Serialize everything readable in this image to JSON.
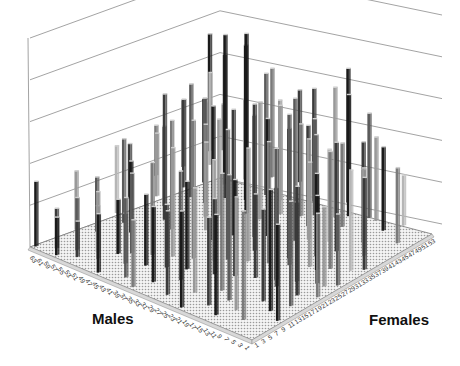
{
  "chart_data": {
    "type": "bar3d",
    "title": "",
    "x_axis": {
      "label": "Males",
      "ticks": [
        63,
        61,
        59,
        57,
        55,
        53,
        51,
        49,
        47,
        45,
        43,
        41,
        39,
        37,
        35,
        33,
        31,
        29,
        27,
        25,
        23,
        21,
        19,
        17,
        15,
        13,
        11,
        9,
        7,
        5,
        3,
        1
      ]
    },
    "y_axis": {
      "label": "Females",
      "ticks": [
        1,
        3,
        5,
        7,
        9,
        11,
        13,
        15,
        17,
        19,
        21,
        23,
        25,
        27,
        29,
        31,
        33,
        35,
        37,
        39,
        41,
        43,
        45,
        47,
        49,
        51,
        53
      ]
    },
    "z_axis": {
      "label": "",
      "gridlines": 5,
      "tick_labels_visible": false
    },
    "grid": true,
    "legend": null,
    "bar_colors": [
      "#1a1a1a",
      "#3a3a3a",
      "#5a5a5a",
      "#7a7a7a",
      "#999999",
      "#b5b5b5"
    ],
    "note": "Sparse 3D bar matrix of male × female pairings; individual bar heights are not labeled. Tallest bar ≈ 4.3 gridline units near the back-right; most bars between 0.5 and 3 units.",
    "bars": [
      {
        "m": 63,
        "f": 1,
        "h": 1.55,
        "c": 0
      },
      {
        "m": 59,
        "f": 3,
        "h": 0.95,
        "c": 1
      },
      {
        "m": 57,
        "f": 1,
        "h": 0.9,
        "c": 0
      },
      {
        "m": 55,
        "f": 5,
        "h": 1.25,
        "c": 2
      },
      {
        "m": 53,
        "f": 3,
        "h": 0.85,
        "c": 1
      },
      {
        "m": 51,
        "f": 7,
        "h": 1.1,
        "c": 3
      },
      {
        "m": 49,
        "f": 5,
        "h": 1.6,
        "c": 4
      },
      {
        "m": 47,
        "f": 9,
        "h": 1.3,
        "c": 0
      },
      {
        "m": 45,
        "f": 11,
        "h": 1.9,
        "c": 2
      },
      {
        "m": 43,
        "f": 7,
        "h": 1.2,
        "c": 1
      },
      {
        "m": 41,
        "f": 13,
        "h": 2.2,
        "c": 3
      },
      {
        "m": 39,
        "f": 9,
        "h": 1.7,
        "c": 0
      },
      {
        "m": 37,
        "f": 15,
        "h": 2.6,
        "c": 4
      },
      {
        "m": 35,
        "f": 11,
        "h": 1.5,
        "c": 1
      },
      {
        "m": 33,
        "f": 17,
        "h": 3.3,
        "c": 3
      },
      {
        "m": 31,
        "f": 13,
        "h": 2.1,
        "c": 0
      },
      {
        "m": 29,
        "f": 19,
        "h": 2.4,
        "c": 5
      },
      {
        "m": 27,
        "f": 21,
        "h": 3.1,
        "c": 2
      },
      {
        "m": 25,
        "f": 15,
        "h": 1.8,
        "c": 1
      },
      {
        "m": 23,
        "f": 23,
        "h": 2.7,
        "c": 4
      },
      {
        "m": 21,
        "f": 17,
        "h": 2.3,
        "c": 0
      },
      {
        "m": 19,
        "f": 25,
        "h": 2.9,
        "c": 3
      },
      {
        "m": 17,
        "f": 19,
        "h": 2.0,
        "c": 1
      },
      {
        "m": 15,
        "f": 27,
        "h": 3.6,
        "c": 2
      },
      {
        "m": 13,
        "f": 21,
        "h": 2.2,
        "c": 0
      },
      {
        "m": 11,
        "f": 29,
        "h": 2.5,
        "c": 4
      },
      {
        "m": 9,
        "f": 23,
        "h": 1.9,
        "c": 1
      },
      {
        "m": 7,
        "f": 31,
        "h": 2.8,
        "c": 3
      },
      {
        "m": 5,
        "f": 25,
        "h": 2.1,
        "c": 0
      },
      {
        "m": 3,
        "f": 33,
        "h": 2.4,
        "c": 5
      },
      {
        "m": 1,
        "f": 27,
        "h": 1.7,
        "c": 2
      },
      {
        "m": 61,
        "f": 11,
        "h": 1.4,
        "c": 4
      },
      {
        "m": 55,
        "f": 19,
        "h": 2.0,
        "c": 2
      },
      {
        "m": 49,
        "f": 25,
        "h": 3.0,
        "c": 1
      },
      {
        "m": 43,
        "f": 31,
        "h": 2.2,
        "c": 3
      },
      {
        "m": 37,
        "f": 37,
        "h": 4.3,
        "c": 0
      },
      {
        "m": 31,
        "f": 41,
        "h": 2.6,
        "c": 4
      },
      {
        "m": 25,
        "f": 45,
        "h": 2.3,
        "c": 2
      },
      {
        "m": 19,
        "f": 49,
        "h": 2.9,
        "c": 0
      },
      {
        "m": 13,
        "f": 51,
        "h": 2.0,
        "c": 4
      },
      {
        "m": 7,
        "f": 53,
        "h": 1.2,
        "c": 5
      },
      {
        "m": 3,
        "f": 47,
        "h": 1.8,
        "c": 3
      },
      {
        "m": 9,
        "f": 43,
        "h": 2.4,
        "c": 1
      },
      {
        "m": 15,
        "f": 39,
        "h": 2.2,
        "c": 5
      },
      {
        "m": 21,
        "f": 35,
        "h": 3.4,
        "c": 2
      },
      {
        "m": 27,
        "f": 33,
        "h": 2.8,
        "c": 0
      },
      {
        "m": 33,
        "f": 29,
        "h": 3.0,
        "c": 1
      },
      {
        "m": 39,
        "f": 27,
        "h": 2.1,
        "c": 4
      },
      {
        "m": 45,
        "f": 23,
        "h": 2.6,
        "c": 3
      },
      {
        "m": 51,
        "f": 17,
        "h": 1.7,
        "c": 0
      },
      {
        "m": 57,
        "f": 13,
        "h": 1.3,
        "c": 2
      },
      {
        "m": 59,
        "f": 21,
        "h": 1.6,
        "c": 5
      },
      {
        "m": 53,
        "f": 29,
        "h": 1.9,
        "c": 3
      },
      {
        "m": 47,
        "f": 35,
        "h": 2.5,
        "c": 2
      },
      {
        "m": 41,
        "f": 41,
        "h": 3.7,
        "c": 0
      },
      {
        "m": 35,
        "f": 45,
        "h": 2.4,
        "c": 4
      },
      {
        "m": 29,
        "f": 49,
        "h": 2.7,
        "c": 1
      },
      {
        "m": 23,
        "f": 53,
        "h": 3.2,
        "c": 0
      },
      {
        "m": 17,
        "f": 45,
        "h": 2.0,
        "c": 3
      },
      {
        "m": 11,
        "f": 37,
        "h": 2.6,
        "c": 1
      },
      {
        "m": 5,
        "f": 39,
        "h": 2.1,
        "c": 4
      },
      {
        "m": 1,
        "f": 9,
        "h": 2.3,
        "c": 0
      },
      {
        "m": 3,
        "f": 15,
        "h": 2.5,
        "c": 2
      },
      {
        "m": 5,
        "f": 11,
        "h": 2.9,
        "c": 0
      },
      {
        "m": 7,
        "f": 5,
        "h": 2.6,
        "c": 3
      },
      {
        "m": 9,
        "f": 13,
        "h": 2.2,
        "c": 1
      },
      {
        "m": 11,
        "f": 7,
        "h": 2.7,
        "c": 4
      },
      {
        "m": 13,
        "f": 3,
        "h": 2.4,
        "c": 0
      },
      {
        "m": 15,
        "f": 9,
        "h": 3.0,
        "c": 2
      },
      {
        "m": 17,
        "f": 5,
        "h": 2.1,
        "c": 1
      },
      {
        "m": 19,
        "f": 11,
        "h": 2.8,
        "c": 3
      },
      {
        "m": 21,
        "f": 1,
        "h": 2.3,
        "c": 0
      },
      {
        "m": 23,
        "f": 7,
        "h": 2.5,
        "c": 4
      },
      {
        "m": 27,
        "f": 3,
        "h": 2.0,
        "c": 1
      },
      {
        "m": 29,
        "f": 9,
        "h": 2.6,
        "c": 2
      },
      {
        "m": 33,
        "f": 5,
        "h": 1.8,
        "c": 0
      },
      {
        "m": 35,
        "f": 1,
        "h": 1.6,
        "c": 3
      },
      {
        "m": 39,
        "f": 3,
        "h": 1.9,
        "c": 2
      },
      {
        "m": 45,
        "f": 1,
        "h": 1.4,
        "c": 0
      },
      {
        "m": 57,
        "f": 31,
        "h": 1.5,
        "c": 4
      },
      {
        "m": 61,
        "f": 27,
        "h": 1.3,
        "c": 1
      },
      {
        "m": 63,
        "f": 37,
        "h": 1.2,
        "c": 3
      },
      {
        "m": 53,
        "f": 41,
        "h": 2.0,
        "c": 0
      },
      {
        "m": 47,
        "f": 47,
        "h": 1.9,
        "c": 5
      },
      {
        "m": 43,
        "f": 51,
        "h": 2.6,
        "c": 3
      },
      {
        "m": 37,
        "f": 53,
        "h": 2.2,
        "c": 1
      },
      {
        "m": 31,
        "f": 51,
        "h": 1.8,
        "c": 4
      },
      {
        "m": 57,
        "f": 47,
        "h": 2.2,
        "c": 5
      },
      {
        "m": 61,
        "f": 51,
        "h": 2.8,
        "c": 0
      },
      {
        "m": 63,
        "f": 53,
        "h": 1.0,
        "c": 5
      },
      {
        "m": 59,
        "f": 53,
        "h": 1.1,
        "c": 4
      },
      {
        "m": 51,
        "f": 35,
        "h": 2.7,
        "c": 2
      },
      {
        "m": 49,
        "f": 43,
        "h": 3.1,
        "c": 1
      },
      {
        "m": 41,
        "f": 33,
        "h": 2.3,
        "c": 4
      },
      {
        "m": 35,
        "f": 25,
        "h": 3.2,
        "c": 0
      },
      {
        "m": 29,
        "f": 31,
        "h": 2.9,
        "c": 3
      },
      {
        "m": 25,
        "f": 27,
        "h": 3.5,
        "c": 1
      },
      {
        "m": 19,
        "f": 37,
        "h": 2.4,
        "c": 4
      },
      {
        "m": 13,
        "f": 33,
        "h": 2.9,
        "c": 2
      },
      {
        "m": 9,
        "f": 29,
        "h": 2.3,
        "c": 0
      },
      {
        "m": 5,
        "f": 19,
        "h": 2.6,
        "c": 1
      },
      {
        "m": 1,
        "f": 21,
        "h": 2.0,
        "c": 3
      },
      {
        "m": 3,
        "f": 25,
        "h": 1.9,
        "c": 4
      },
      {
        "m": 23,
        "f": 41,
        "h": 2.4,
        "c": 1
      },
      {
        "m": 27,
        "f": 43,
        "h": 2.2,
        "c": 3
      },
      {
        "m": 17,
        "f": 29,
        "h": 3.1,
        "c": 0
      },
      {
        "m": 11,
        "f": 19,
        "h": 3.3,
        "c": 2
      },
      {
        "m": 33,
        "f": 37,
        "h": 2.8,
        "c": 4
      },
      {
        "m": 39,
        "f": 45,
        "h": 2.9,
        "c": 2
      },
      {
        "m": 45,
        "f": 39,
        "h": 3.9,
        "c": 0
      },
      {
        "m": 55,
        "f": 37,
        "h": 2.1,
        "c": 1
      },
      {
        "m": 61,
        "f": 43,
        "h": 1.6,
        "c": 3
      },
      {
        "m": 21,
        "f": 47,
        "h": 3.1,
        "c": 4
      },
      {
        "m": 15,
        "f": 51,
        "h": 2.5,
        "c": 2
      },
      {
        "m": 9,
        "f": 49,
        "h": 2.0,
        "c": 0
      },
      {
        "m": 7,
        "f": 41,
        "h": 1.9,
        "c": 3
      },
      {
        "m": 1,
        "f": 35,
        "h": 2.2,
        "c": 1
      }
    ]
  },
  "labels": {
    "males": "Males",
    "females": "Females"
  }
}
